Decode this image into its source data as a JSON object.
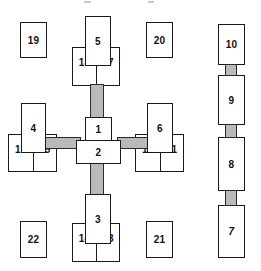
{
  "diagram": {
    "type": "schematic-block-diagram",
    "background_color": "#ffffff",
    "box_border_color": "#1a1a1a",
    "connector_color": "#b9b9b9",
    "label_color": "#111111",
    "central_cluster": {
      "hub_upper": {
        "label": "1"
      },
      "hub_lower": {
        "label": "2"
      },
      "north_arm": {
        "stem": {
          "label": "5"
        },
        "pair_left": {
          "label": "18"
        },
        "pair_right": {
          "label": "17"
        }
      },
      "south_arm": {
        "stem": {
          "label": "3"
        },
        "pair_left": {
          "label": "14"
        },
        "pair_right": {
          "label": "13"
        }
      },
      "west_arm": {
        "stem": {
          "label": "4"
        },
        "pair_left": {
          "label": "16"
        },
        "pair_right": {
          "label": "15"
        }
      },
      "east_arm": {
        "stem": {
          "label": "6"
        },
        "pair_left": {
          "label": "12"
        },
        "pair_right": {
          "label": "11"
        }
      }
    },
    "corner_boxes": [
      {
        "label": "19",
        "position": "top-left"
      },
      {
        "label": "20",
        "position": "top-right"
      },
      {
        "label": "22",
        "position": "bottom-left"
      },
      {
        "label": "21",
        "position": "bottom-right"
      }
    ],
    "right_chain": {
      "orientation": "vertical",
      "nodes": [
        {
          "label": "10",
          "style": "normal"
        },
        {
          "label": "9",
          "style": "normal"
        },
        {
          "label": "8",
          "style": "normal"
        },
        {
          "label": "7",
          "style": "italic"
        }
      ]
    }
  }
}
